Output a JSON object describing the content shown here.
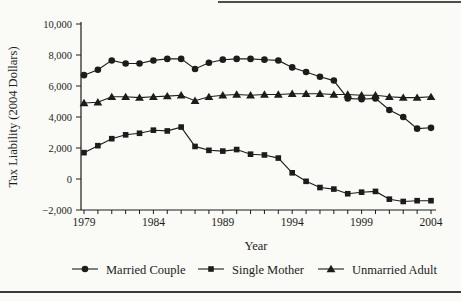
{
  "figure": {
    "kind": "line chart",
    "background": "#fafaf6",
    "ink_color": "#1c1c1c",
    "rule_color": "#4d4d4d"
  },
  "chart_data": {
    "type": "line",
    "title": "",
    "xlabel": "Year",
    "ylabel": "Tax Liability  (2004 Dollars)",
    "x": [
      1979,
      1980,
      1981,
      1982,
      1983,
      1984,
      1985,
      1986,
      1987,
      1988,
      1989,
      1990,
      1991,
      1992,
      1993,
      1994,
      1995,
      1996,
      1997,
      1998,
      1999,
      2000,
      2001,
      2002,
      2003,
      2004
    ],
    "x_label_years": [
      1979,
      1984,
      1989,
      1994,
      1999,
      2004
    ],
    "x_tick_labels": [
      "1979",
      "1984",
      "1989",
      "1994",
      "1999",
      "2004"
    ],
    "y_ticks": [
      -2000,
      0,
      2000,
      4000,
      6000,
      8000,
      10000
    ],
    "y_tick_labels": [
      "−2,000",
      "0",
      "2,000",
      "4,000",
      "6,000",
      "8,000",
      "10,000"
    ],
    "ylim": [
      -2000,
      10000
    ],
    "grid": false,
    "legend_position": "bottom",
    "series": [
      {
        "name": "Married Couple",
        "marker": "circle",
        "color": "#1c1c1c",
        "values": [
          6700,
          7050,
          7650,
          7450,
          7450,
          7650,
          7750,
          7750,
          7100,
          7500,
          7700,
          7750,
          7750,
          7700,
          7650,
          7200,
          6900,
          6600,
          6350,
          5200,
          5150,
          5200,
          4450,
          4000,
          3250,
          3300
        ]
      },
      {
        "name": "Single Mother",
        "marker": "square",
        "color": "#1c1c1c",
        "values": [
          1700,
          2150,
          2600,
          2850,
          2950,
          3150,
          3100,
          3350,
          2100,
          1850,
          1800,
          1900,
          1600,
          1550,
          1350,
          400,
          -150,
          -550,
          -650,
          -950,
          -850,
          -800,
          -1300,
          -1450,
          -1400,
          -1400
        ]
      },
      {
        "name": "Unmarried Adult",
        "marker": "triangle",
        "color": "#1c1c1c",
        "values": [
          4900,
          4950,
          5300,
          5300,
          5250,
          5300,
          5350,
          5400,
          5050,
          5300,
          5400,
          5450,
          5400,
          5450,
          5450,
          5500,
          5500,
          5500,
          5450,
          5450,
          5400,
          5400,
          5300,
          5250,
          5250,
          5300
        ]
      }
    ]
  }
}
